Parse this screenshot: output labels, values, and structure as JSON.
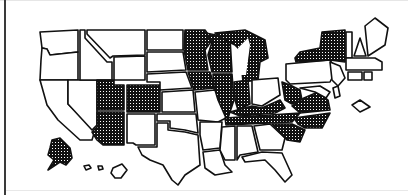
{
  "map": {
    "type": "us-state-choropleth",
    "colors": {
      "background": "#ffffff",
      "outline": "#111111",
      "shaded_fill": "#111111",
      "shaded_pattern_dot": "#ffffff",
      "unshaded_fill": "#ffffff"
    },
    "legend": null,
    "shaded_states": [
      "MN",
      "WI",
      "MI",
      "IA",
      "IL",
      "IN",
      "UT",
      "CO",
      "AZ",
      "NY",
      "PA",
      "WV",
      "VA",
      "TN",
      "NC",
      "SC",
      "KY",
      "AK"
    ],
    "unshaded_states": [
      "WA",
      "OR",
      "CA",
      "ID",
      "NV",
      "MT",
      "WY",
      "NM",
      "ND",
      "SD",
      "NE",
      "KS",
      "OK",
      "TX",
      "MO",
      "AR",
      "LA",
      "MS",
      "AL",
      "GA",
      "FL",
      "OH",
      "ME",
      "VT",
      "NH",
      "MA",
      "CT",
      "RI",
      "NJ",
      "DE",
      "MD",
      "HI"
    ]
  }
}
